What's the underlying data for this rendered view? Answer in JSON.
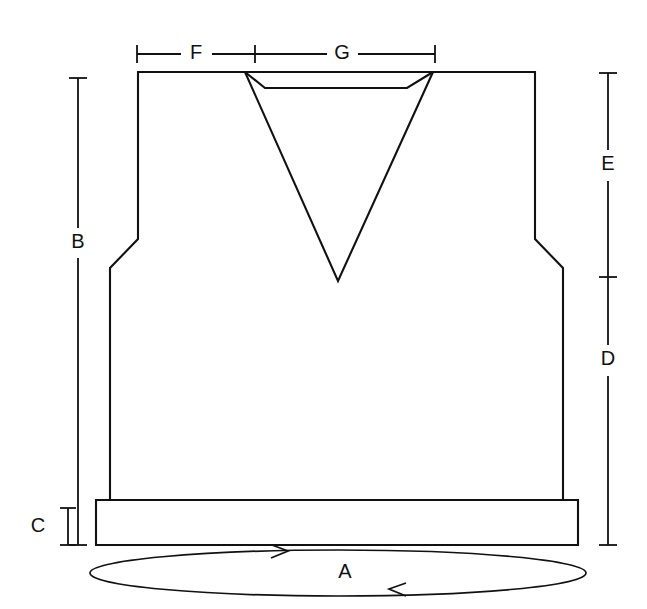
{
  "diagram": {
    "type": "technical-garment-schematic",
    "background_color": "#ffffff",
    "line_color": "#111111",
    "labels": {
      "A": "A",
      "B": "B",
      "C": "C",
      "D": "D",
      "E": "E",
      "F": "F",
      "G": "G"
    },
    "measurements": [
      {
        "key": "A",
        "label": "A",
        "orientation": "horizontal",
        "style": "circumference-ellipse-double-arrow",
        "position": "bottom",
        "describes": "body circumference around hem",
        "label_x": 345,
        "label_y": 578
      },
      {
        "key": "B",
        "label": "B",
        "orientation": "vertical",
        "style": "tick-terminated",
        "position": "left-outer",
        "describes": "total body length from shoulder to hem",
        "label_x": 78,
        "label_y": 243,
        "x": 78,
        "y_top": 78,
        "y_bottom": 545
      },
      {
        "key": "C",
        "label": "C",
        "orientation": "vertical",
        "style": "tick-terminated",
        "position": "left-outer-lower",
        "describes": "bottom rib band depth",
        "label_x": 38,
        "label_y": 530,
        "x": 68,
        "y_top": 508,
        "y_bottom": 545
      },
      {
        "key": "D",
        "label": "D",
        "orientation": "vertical",
        "style": "tick-terminated",
        "position": "right-outer-lower",
        "describes": "length from underarm to hem",
        "label_x": 608,
        "label_y": 360,
        "x": 608,
        "y_top": 277,
        "y_bottom": 545
      },
      {
        "key": "E",
        "label": "E",
        "orientation": "vertical",
        "style": "tick-terminated",
        "position": "right-outer-upper",
        "describes": "armhole depth from shoulder to underarm",
        "label_x": 608,
        "label_y": 165,
        "x": 608,
        "y_top": 73,
        "y_bottom": 277
      },
      {
        "key": "F",
        "label": "F",
        "orientation": "horizontal",
        "style": "tick-terminated",
        "position": "top",
        "describes": "shoulder width",
        "label_x": 196,
        "label_y": 48,
        "y": 54,
        "x_left": 137,
        "x_right": 255
      },
      {
        "key": "G",
        "label": "G",
        "orientation": "horizontal",
        "style": "tick-terminated",
        "position": "top",
        "describes": "neck opening width",
        "label_x": 342,
        "label_y": 48,
        "y": 54,
        "x_left": 255,
        "x_right": 435
      }
    ],
    "geometry": {
      "body_outline_points": "138,72 138,239 110,268 110,500 96,500 96,545 578,545 578,500 563,500 563,268 535,239 535,72 433,72 407,88 265,88 245,72",
      "body_outline_note": "shoulders at top, chamfered armholes, straight side seams, inset rib band at hem",
      "neck_v_left": "245,72 338,281",
      "neck_v_right": "338,281 433,72",
      "neckband_left": "245,72 265,88",
      "neckband_right": "407,88 433,72",
      "neckband_bottom": "265,88 407,88",
      "hem_band_top_y": 500,
      "hem_band_bottom_y": 545,
      "hem_band_left_x": 96,
      "hem_band_right_x": 578,
      "v_neck_point": {
        "x": 338,
        "y": 281
      }
    },
    "circumference_ellipse": {
      "cx": 338,
      "cy": 573,
      "rx": 248,
      "ry": 23,
      "arrow_top": {
        "x": 285,
        "y": 553,
        "direction": "right"
      },
      "arrow_bottom": {
        "x": 400,
        "y": 594,
        "direction": "left"
      }
    }
  }
}
